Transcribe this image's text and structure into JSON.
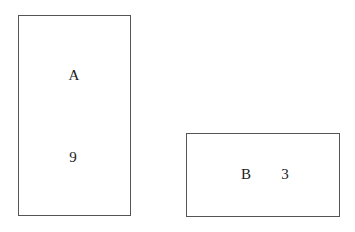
{
  "boxes": [
    {
      "id": "A",
      "label": "A",
      "value": "9"
    },
    {
      "id": "B",
      "label": "B",
      "value": "3"
    }
  ],
  "colors": {
    "border": "#555555",
    "text": "#1a1a1a",
    "background": "#ffffff"
  }
}
